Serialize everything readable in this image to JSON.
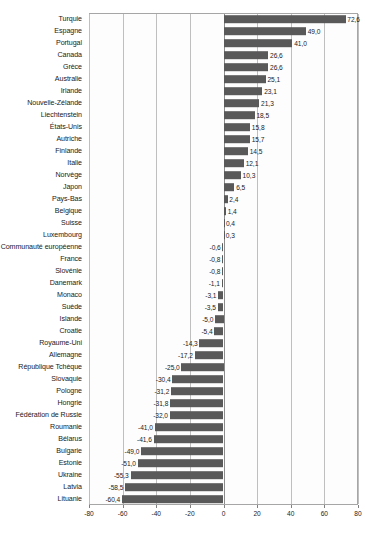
{
  "chart_data": {
    "type": "bar",
    "orientation": "horizontal",
    "title": "",
    "subtitle": "",
    "xlabel": "",
    "ylabel": "",
    "xlim": [
      -80,
      80
    ],
    "xticks": [
      -80,
      -60,
      -40,
      -20,
      0,
      20,
      40,
      60,
      80
    ],
    "xtick_labels": [
      "-80",
      "-60",
      "-40",
      "-20",
      "0",
      "20",
      "40",
      "60",
      "80"
    ],
    "grid": true,
    "legend": null,
    "decimal_separator": ",",
    "bar_color": "#595959",
    "gridline_color": "#bfbfbf",
    "plot_border_color": "#a6a6a6",
    "categories": [
      "Turquie",
      "Espagne",
      "Portugal",
      "Canada",
      "Grèce",
      "Australie",
      "Irlande",
      "Nouvelle-Zélande",
      "Liechtenstein",
      "États-Unis",
      "Autriche",
      "Finlande",
      "Italie",
      "Norvège",
      "Japon",
      "Pays-Bas",
      "Belgique",
      "Suisse",
      "Luxembourg",
      "Communauté européenne",
      "France",
      "Slovénie",
      "Danemark",
      "Monaco",
      "Suède",
      "Islande",
      "Croatie",
      "Royaume-Uni",
      "Allemagne",
      "République Tchèque",
      "Slovaquie",
      "Pologne",
      "Hongrie",
      "Fédération de Russie",
      "Roumanie",
      "Bélarus",
      "Bulgarie",
      "Estonie",
      "Ukraine",
      "Latvia",
      "Lituanie"
    ],
    "values": [
      72.6,
      49.0,
      41.0,
      26.6,
      26.6,
      25.1,
      23.1,
      21.3,
      18.5,
      15.8,
      15.7,
      14.5,
      12.1,
      10.3,
      6.5,
      2.4,
      1.4,
      0.4,
      0.3,
      -0.6,
      -0.8,
      -0.8,
      -1.1,
      -3.1,
      -3.5,
      -5.0,
      -5.4,
      -14.3,
      -17.2,
      -25.0,
      -30.4,
      -31.2,
      -31.8,
      -32.0,
      -41.0,
      -41.6,
      -49.0,
      -51.0,
      -55.3,
      -58.5,
      -60.4
    ],
    "value_labels": [
      "72,6",
      "49,0",
      "41,0",
      "26,6",
      "26,6",
      "25,1",
      "23,1",
      "21,3",
      "18,5",
      "15,8",
      "15,7",
      "14,5",
      "12,1",
      "10,3",
      "6,5",
      "2,4",
      "1,4",
      "0,4",
      "0,3",
      "-0,6",
      "-0,8",
      "-0,8",
      "-1,1",
      "-3,1",
      "-3,5",
      "-5,0",
      "-5,4",
      "-14,3",
      "-17,2",
      "-25,0",
      "-30,4",
      "-31,2",
      "-31,8",
      "-32,0",
      "-41,0",
      "-41,6",
      "-49,0",
      "-51,0",
      "-55,3",
      "-58,5",
      "-60,4"
    ]
  }
}
